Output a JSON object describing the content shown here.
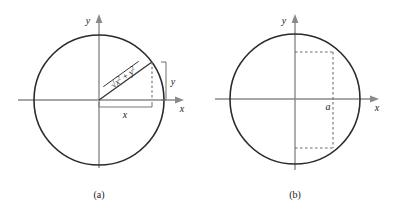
{
  "figure": {
    "panels": [
      {
        "id": "panel-a",
        "caption": "(a)",
        "axis_x_label": "x",
        "axis_y_label": "y",
        "circle": {
          "cx": 99,
          "cy": 100,
          "r": 65
        },
        "radius_point": {
          "x": 152,
          "y": 62
        },
        "radius_expression": {
          "radical": "√",
          "term1_base": "x",
          "term1_exp": "2",
          "operator": "+",
          "term2_base": "y",
          "term2_exp": "2",
          "plain": "√(x² + y²)"
        },
        "bracket_x_label": "x",
        "bracket_y_label": "y"
      },
      {
        "id": "panel-b",
        "caption": "(b)",
        "axis_x_label": "x",
        "axis_y_label": "y",
        "circle": {
          "cx": 295,
          "cy": 99,
          "r": 65
        },
        "chord_label": "a",
        "chord_x": 333,
        "chord_top_y": 52,
        "chord_bottom_y": 148
      }
    ],
    "colors": {
      "circle_stroke": "#2b2b2b",
      "axis_stroke": "#8a8a8a",
      "radius_stroke": "#3a3a3a",
      "dashed_stroke": "#6e6e6e",
      "bracket_stroke": "#7a7a7a",
      "text": "#1a1a1a",
      "background": "#ffffff"
    }
  }
}
